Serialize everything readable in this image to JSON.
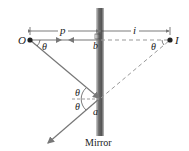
{
  "diagram": {
    "labels": {
      "object": "O",
      "image": "I",
      "object_distance": "p",
      "image_distance": "i",
      "point_b": "b",
      "point_a": "a",
      "theta": "θ",
      "mirror": "Mirror"
    },
    "colors": {
      "mirror_dark": "#5a5a5a",
      "mirror_light": "#b8b8b8",
      "ray": "#777777",
      "dashed": "#999999",
      "dot": "#222222",
      "text": "#222222"
    }
  }
}
